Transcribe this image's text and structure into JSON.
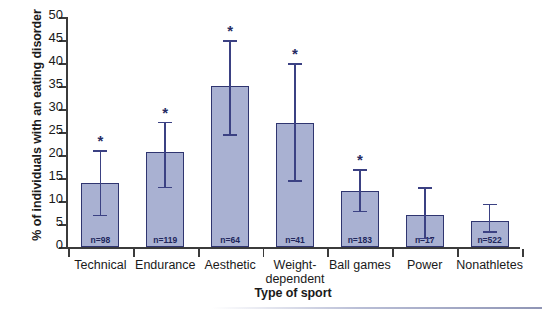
{
  "chart_data": {
    "type": "bar",
    "title": "",
    "xlabel": "Type of sport",
    "ylabel": "% of individuals with an eating disorder",
    "ylim": [
      0,
      50
    ],
    "yticks": [
      0,
      5,
      10,
      15,
      20,
      25,
      30,
      35,
      40,
      45,
      50
    ],
    "ytick_labels": [
      "0",
      "5",
      "10",
      "15",
      "20",
      "25",
      "30",
      "35",
      "40",
      "45",
      "50"
    ],
    "grid": false,
    "legend": "none",
    "categories": [
      "Technical",
      "Endurance",
      "Aesthetic",
      "Weight-dependent",
      "Ball games",
      "Power",
      "Nonathletes"
    ],
    "category_lines": [
      [
        "Technical"
      ],
      [
        "Endurance"
      ],
      [
        "Aesthetic"
      ],
      [
        "Weight-",
        "dependent"
      ],
      [
        "Ball games"
      ],
      [
        "Power"
      ],
      [
        "Nonathletes"
      ]
    ],
    "values": [
      13.9,
      20.6,
      35.0,
      27.0,
      12.2,
      7.0,
      5.7
    ],
    "error_low": [
      7.0,
      13.1,
      24.5,
      14.5,
      7.9,
      2.0,
      3.4
    ],
    "error_high": [
      21.0,
      27.2,
      45.0,
      40.0,
      16.9,
      13.0,
      9.4
    ],
    "sample_labels": [
      "n=98",
      "n=119",
      "n=64",
      "n=41",
      "n=183",
      "n=17",
      "n=522"
    ],
    "sample_sizes": [
      98,
      119,
      64,
      41,
      183,
      17,
      522
    ],
    "significance_markers": [
      "*",
      "*",
      "*",
      "*",
      "*",
      "",
      ""
    ],
    "significant": [
      true,
      true,
      true,
      true,
      true,
      false,
      false
    ],
    "bar_fill_color": "#a9b1d2",
    "bar_edge_color": "#2f3570",
    "error_bar_color": "#3b4183",
    "axis_color": "#3b3b3b"
  }
}
